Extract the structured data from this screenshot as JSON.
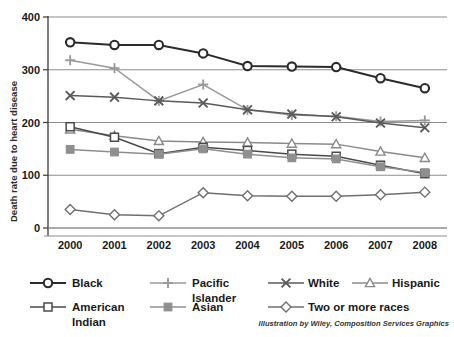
{
  "chart_data": {
    "type": "line",
    "title": "",
    "subtitle": "",
    "xlabel": "",
    "ylabel": "Death rate due to heart disease",
    "categories": [
      "2000",
      "2001",
      "2002",
      "2003",
      "2004",
      "2005",
      "2006",
      "2007",
      "2008"
    ],
    "x": [
      2000,
      2001,
      2002,
      2003,
      2004,
      2005,
      2006,
      2007,
      2008
    ],
    "ylim": [
      0,
      400
    ],
    "yticks": [
      0,
      100,
      200,
      300,
      400
    ],
    "ytick_labels": [
      "0",
      "100",
      "200",
      "300",
      "400"
    ],
    "grid": "horizontal",
    "legend_position": "bottom",
    "series": [
      {
        "name": "Black",
        "marker": "circle",
        "color": "#2b2b2b",
        "values": [
          352,
          347,
          347,
          331,
          307,
          306,
          305,
          284,
          265
        ]
      },
      {
        "name": "Pacific Islander",
        "marker": "plus",
        "color": "#9a9a9a",
        "values": [
          318,
          303,
          241,
          272,
          224,
          214,
          212,
          202,
          204
        ]
      },
      {
        "name": "White",
        "marker": "x",
        "color": "#5a5a5a",
        "values": [
          251,
          248,
          241,
          237,
          224,
          216,
          211,
          199,
          190
        ]
      },
      {
        "name": "Hispanic",
        "marker": "triangle",
        "color": "#8a8a8a",
        "values": [
          187,
          175,
          165,
          163,
          162,
          160,
          159,
          145,
          133
        ]
      },
      {
        "name": "American Indian",
        "marker": "square-open",
        "color": "#4a4a4a",
        "values": [
          192,
          172,
          141,
          153,
          147,
          140,
          136,
          119,
          103
        ]
      },
      {
        "name": "Asian",
        "marker": "square-filled",
        "color": "#8f8f8f",
        "values": [
          149,
          144,
          140,
          150,
          140,
          133,
          131,
          116,
          105
        ]
      },
      {
        "name": "Two or more races",
        "marker": "diamond",
        "color": "#6f6f6f",
        "values": [
          35,
          25,
          23,
          67,
          61,
          60,
          60,
          63,
          68
        ]
      }
    ],
    "credit": "Illustration by Wiley, Composition Services Graphics"
  },
  "legend": {
    "items": [
      {
        "label": "Black"
      },
      {
        "label": "Pacific\nIslander"
      },
      {
        "label": "White"
      },
      {
        "label": "Hispanic"
      },
      {
        "label": "American\nIndian"
      },
      {
        "label": "Asian"
      },
      {
        "label": "Two or more races"
      }
    ]
  },
  "axis": {
    "y_title": "Death rate due to heart disease",
    "y_ticks": [
      "400",
      "300",
      "200",
      "100",
      "0"
    ],
    "x_ticks": [
      "2000",
      "2001",
      "2002",
      "2003",
      "2004",
      "2005",
      "2006",
      "2007",
      "2008"
    ]
  },
  "credit": {
    "text": "Illustration by Wiley, Composition Services Graphics"
  }
}
